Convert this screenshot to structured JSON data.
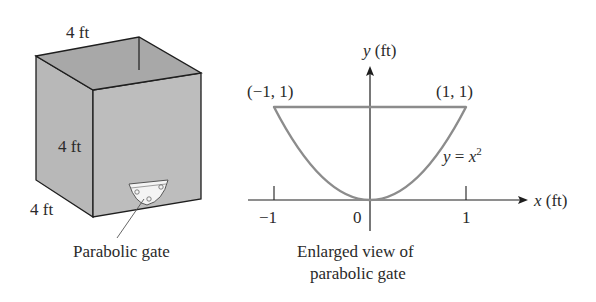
{
  "tank": {
    "top_label": "4 ft",
    "height_label": "4 ft",
    "depth_label": "4 ft",
    "gate_label": "Parabolic gate",
    "colors": {
      "face": "#b9b9b9",
      "top": "#a9a9a9",
      "edge": "#1e1e1e"
    }
  },
  "graph": {
    "y_axis_var": "y",
    "y_axis_unit": "(ft)",
    "x_axis_var": "x",
    "x_axis_unit": "(ft)",
    "point_left": "(−1, 1)",
    "point_right": "(1, 1)",
    "curve_label_lhs": "y",
    "curve_label_eq": " = ",
    "curve_label_var": "x",
    "curve_label_exp": "2",
    "tick_neg1": "−1",
    "tick_0": "0",
    "tick_1": "1",
    "caption_line1": "Enlarged view of",
    "caption_line2": "parabolic gate",
    "curve_color": "#8c8c8c"
  }
}
